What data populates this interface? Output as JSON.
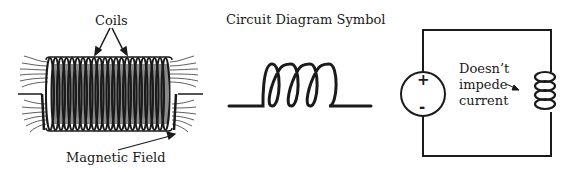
{
  "panels": {
    "physical": {
      "coils_label": "Coils",
      "field_label": "Magnetic Field",
      "turns": 22
    },
    "symbol": {
      "title": "Circuit Diagram Symbol",
      "loops": 4
    },
    "circuit": {
      "source_plus": "+",
      "source_minus": "-",
      "note_line1": "Doesn’t",
      "note_line2": "impede",
      "note_line3": "current",
      "inductor_loops": 4
    }
  },
  "colors": {
    "ink": "#1a1a1a",
    "background": "#ffffff"
  }
}
